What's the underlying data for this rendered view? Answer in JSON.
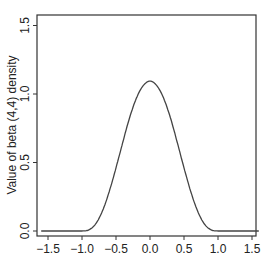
{
  "chart_data": {
    "type": "line",
    "title": "",
    "xlabel": "",
    "ylabel": "Value of beta (4,4) density",
    "xlim": [
      -1.6,
      1.6
    ],
    "ylim": [
      -0.03,
      1.58
    ],
    "grid": false,
    "legend": null,
    "x_ticks": [
      "-1.5",
      "-1.0",
      "-0.5",
      "0.0",
      "0.5",
      "1.0",
      "1.5"
    ],
    "y_ticks": [
      "0.0",
      "0.5",
      "1.0",
      "1.5"
    ],
    "series": [
      {
        "name": "beta(4,4) density on [-1,1]",
        "x": [
          -1.6,
          -1.5,
          -1.0,
          -0.9,
          -0.8,
          -0.7,
          -0.6,
          -0.5,
          -0.4,
          -0.3,
          -0.2,
          -0.1,
          0.0,
          0.1,
          0.2,
          0.3,
          0.4,
          0.5,
          0.6,
          0.7,
          0.8,
          0.9,
          1.0,
          1.5,
          1.6
        ],
        "y": [
          0.0,
          0.0,
          0.0,
          0.008,
          0.051,
          0.145,
          0.287,
          0.461,
          0.648,
          0.827,
          0.97,
          1.061,
          1.094,
          1.061,
          0.97,
          0.827,
          0.648,
          0.461,
          0.287,
          0.145,
          0.051,
          0.008,
          0.0,
          0.0,
          0.0
        ]
      }
    ]
  }
}
